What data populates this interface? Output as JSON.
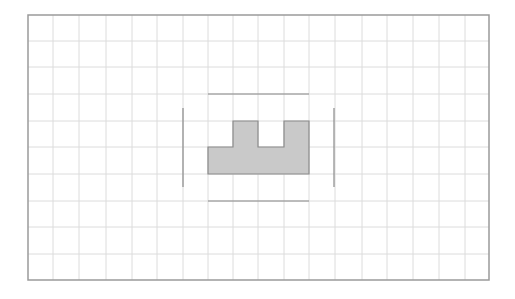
{
  "canvas": {
    "width": 515,
    "height": 299,
    "background": "#ffffff"
  },
  "grid": {
    "frame": {
      "x": 28,
      "y": 15,
      "width": 461,
      "height": 265,
      "stroke": "#9a9a9a"
    },
    "vertical_lines_x": [
      53,
      79,
      106,
      132,
      157,
      183,
      208,
      233,
      258,
      284,
      309,
      335,
      362,
      387,
      413,
      439,
      465
    ],
    "horizontal_lines_y": [
      41,
      67,
      94,
      121,
      147,
      174,
      201,
      227,
      254
    ],
    "line_color": "#dcdcdc"
  },
  "shape": {
    "points": [
      [
        208,
        147
      ],
      [
        233,
        147
      ],
      [
        233,
        121
      ],
      [
        258,
        121
      ],
      [
        258,
        147
      ],
      [
        284,
        147
      ],
      [
        284,
        121
      ],
      [
        309,
        121
      ],
      [
        309,
        174
      ],
      [
        208,
        174
      ]
    ],
    "fill": "#c9c9c9",
    "stroke": "#8a8a8a"
  },
  "guide_lines": {
    "color": "#8a8a8a",
    "top": {
      "x1": 208,
      "y1": 94,
      "x2": 309,
      "y2": 94
    },
    "bottom": {
      "x1": 208,
      "y1": 201,
      "x2": 309,
      "y2": 201
    },
    "left": {
      "x1": 183,
      "y1": 108,
      "x2": 183,
      "y2": 187
    },
    "right": {
      "x1": 334,
      "y1": 108,
      "x2": 334,
      "y2": 187
    }
  }
}
